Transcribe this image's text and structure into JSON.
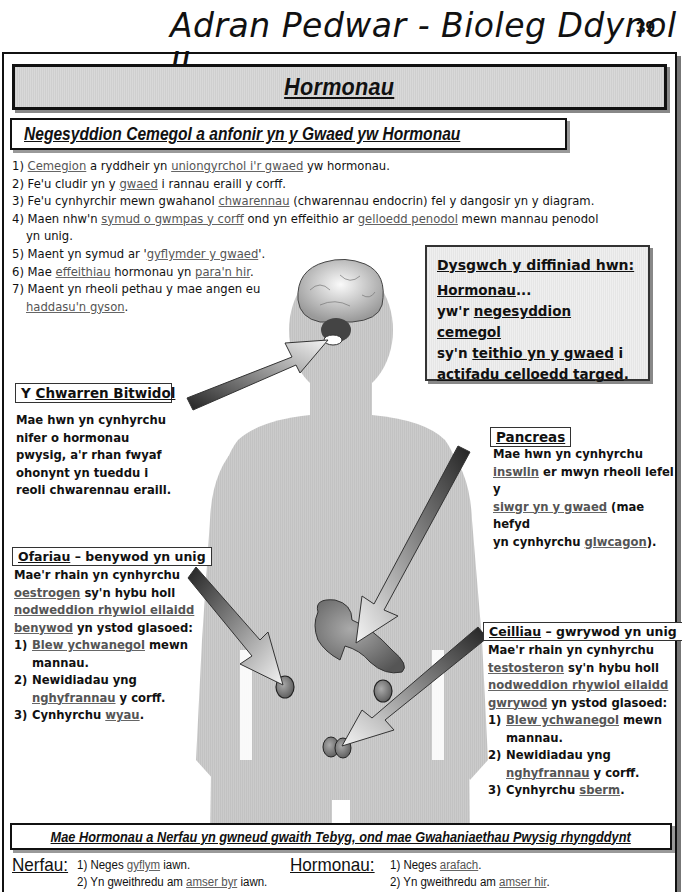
{
  "header": {
    "title": "Adran Pedwar - Bioleg Ddynol II",
    "page_number": "39"
  },
  "banner": {
    "title": "Hormonau"
  },
  "subheading": "Negesyddion Cemegol a anfonir yn y Gwaed yw Hormonau",
  "facts": [
    {
      "num": "1)",
      "parts": [
        {
          "t": "Cemegion",
          "u": true
        },
        {
          "t": " a ryddheir yn "
        },
        {
          "t": "uniongyrchol i'r gwaed",
          "u": true
        },
        {
          "t": " yw hormonau."
        }
      ]
    },
    {
      "num": "2)",
      "parts": [
        {
          "t": "Fe'u cludir yn y "
        },
        {
          "t": "gwaed",
          "u": true
        },
        {
          "t": " i rannau eraill y corff."
        }
      ]
    },
    {
      "num": "3)",
      "parts": [
        {
          "t": "Fe'u cynhyrchir mewn gwahanol "
        },
        {
          "t": "chwarennau",
          "u": true
        },
        {
          "t": " (chwarennau endocrin) fel y dangosir yn y diagram."
        }
      ]
    },
    {
      "num": "4)",
      "parts": [
        {
          "t": "Maen nhw'n "
        },
        {
          "t": "symud o gwmpas y corff",
          "u": true
        },
        {
          "t": " ond yn effeithio ar "
        },
        {
          "t": "gelloedd penodol",
          "u": true
        },
        {
          "t": " mewn mannau penodol"
        }
      ],
      "cont": "yn unig."
    },
    {
      "num": "5)",
      "parts": [
        {
          "t": "Maent yn symud ar '"
        },
        {
          "t": "gyflymder y gwaed",
          "u": true
        },
        {
          "t": "'."
        }
      ]
    },
    {
      "num": "6)",
      "parts": [
        {
          "t": "Mae "
        },
        {
          "t": "effeithiau",
          "u": true
        },
        {
          "t": " hormonau yn "
        },
        {
          "t": "para'n hir",
          "u": true
        },
        {
          "t": "."
        }
      ]
    },
    {
      "num": "7)",
      "parts": [
        {
          "t": "Maent yn rheoli pethau y mae angen eu"
        }
      ],
      "cont_parts": [
        {
          "t": "haddasu'n gyson",
          "u": true
        },
        {
          "t": "."
        }
      ]
    }
  ],
  "definition": {
    "title": "Dysgwch y diffiniad hwn:",
    "term": "Hormonau",
    "ellipsis": "...",
    "line1_pre": "yw'r ",
    "line1_u": "negesyddion cemegol",
    "line2_pre": "sy'n ",
    "line2_u": "teithio yn y gwaed",
    "line2_post": " i",
    "line3_u": "actifadu celloedd targed",
    "line3_post": "."
  },
  "pituitary": {
    "label_pre": "Y ",
    "label_u": "Chwarren Bitwidol",
    "lines": [
      "Mae hwn yn cynhyrchu",
      "nifer o hormonau",
      "pwysig, a'r rhan fwyaf",
      "ohonynt yn tueddu i",
      "reoli chwarennau eraill."
    ]
  },
  "pancreas": {
    "label": "Pancreas",
    "line1": "Mae hwn yn cynhyrchu",
    "line2_u": "inswlin",
    "line2_post": " er mwyn rheoli lefel y",
    "line3_u": "siwgr yn y gwaed",
    "line3_post": " (mae hefyd",
    "line4_pre": "yn cynhyrchu ",
    "line4_u": "glwcagon",
    "line4_post": ")."
  },
  "ovaries": {
    "label_u": "Ofariau",
    "label_post": " – benywod yn unig",
    "line1": "Mae'r rhain yn cynhyrchu",
    "line2_u": "oestrogen",
    "line2_post": " sy'n hybu holl",
    "line3_u": "nodweddion rhywiol eilaidd",
    "line4_u": "benywod",
    "line4_post": " yn ystod glasoed:",
    "items": [
      {
        "num": "1)",
        "u": "Blew ychwanegol",
        "post": " mewn",
        "cont": "mannau."
      },
      {
        "num": "2)",
        "pre": "Newidiadau yng",
        "cont_u": "nghyfrannau",
        "cont_post": " y corff."
      },
      {
        "num": "3)",
        "pre": "Cynhyrchu ",
        "u": "wyau",
        "post": "."
      }
    ]
  },
  "testes": {
    "label_u": "Ceilliau",
    "label_post": " – gwrywod yn unig",
    "line1": "Mae'r rhain yn cynhyrchu",
    "line2_u": "testosteron",
    "line2_post": " sy'n hybu holl",
    "line3_u": "nodweddion rhywiol eilaidd",
    "line4_u": "gwrywod",
    "line4_post": " yn ystod glasoed:",
    "items": [
      {
        "num": "1)",
        "u": "Blew ychwanegol",
        "post": " mewn",
        "cont": "mannau."
      },
      {
        "num": "2)",
        "pre": "Newidiadau yng",
        "cont_u": "nghyfrannau",
        "cont_post": " y corff."
      },
      {
        "num": "3)",
        "pre": "Cynhyrchu ",
        "u": "sberm",
        "post": "."
      }
    ]
  },
  "comparison": {
    "title": "Mae Hormonau a Nerfau yn gwneud gwaith Tebyg, ond mae Gwahaniaethau Pwysig rhyngddynt",
    "nerves": {
      "heading": "Nerfau:",
      "item1_pre": "1) Neges ",
      "item1_u": "gyflym",
      "item1_post": " iawn.",
      "item2_pre": "2) Yn gweithredu am ",
      "item2_u": "amser byr",
      "item2_post": " iawn."
    },
    "hormones": {
      "heading": "Hormonau:",
      "item1_pre": "1) Neges ",
      "item1_u": "arafach",
      "item1_post": ".",
      "item2_pre": "2) Yn gweithredu am ",
      "item2_u": "amser hir",
      "item2_post": "."
    }
  },
  "colors": {
    "body_fill": "#c9c9c9",
    "banner_fill": "#d4d4d4",
    "def_fill": "#ebebeb",
    "ink": "#111111",
    "underline_ink": "#555555"
  }
}
